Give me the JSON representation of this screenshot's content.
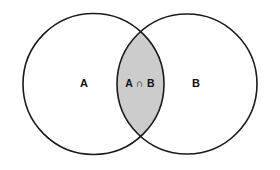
{
  "diagram": {
    "type": "venn",
    "background_color": "#ffffff",
    "stroke_color": "#1a1a1a",
    "stroke_width": 1.6,
    "fill_color": "#ffffff",
    "intersection_fill_color": "#cccccc"
  },
  "sets": {
    "left": {
      "label": "A",
      "label_x": 84,
      "label_y": 84,
      "center_x": 93.5,
      "center_y": 84,
      "radius": 70.5,
      "fill": "#ffffff"
    },
    "right": {
      "label": "B",
      "label_x": 196,
      "label_y": 84,
      "center_x": 187,
      "center_y": 84,
      "radius": 70,
      "fill": "#ffffff"
    }
  },
  "intersection": {
    "label": "A ∩ B",
    "label_x": 140,
    "label_y": 84,
    "fill": "#cccccc"
  }
}
